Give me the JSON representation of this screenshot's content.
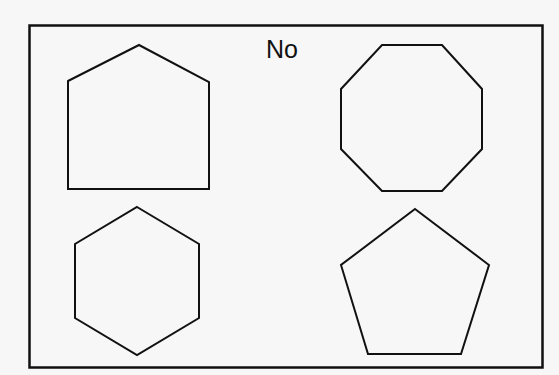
{
  "card": {
    "title": "No",
    "colors": {
      "stroke": "#111111",
      "background": "#f7f7f7"
    }
  },
  "shapes": [
    {
      "name": "house-pentagon",
      "position": "top-left",
      "sides": 5,
      "points": "68,81 139,45 209,82 209,189 68,189"
    },
    {
      "name": "octagon",
      "position": "top-right",
      "sides": 8,
      "points": "382,45 442,45 482,89 482,149 442,191 382,191 341,149 341,89"
    },
    {
      "name": "hexagon",
      "position": "bottom-left",
      "sides": 6,
      "points": "137,207 199,244 199,318 137,355 75,318 75,244"
    },
    {
      "name": "pentagon",
      "position": "bottom-right",
      "sides": 5,
      "points": "415,209 489,265 461,354 368,354 341,265"
    }
  ]
}
